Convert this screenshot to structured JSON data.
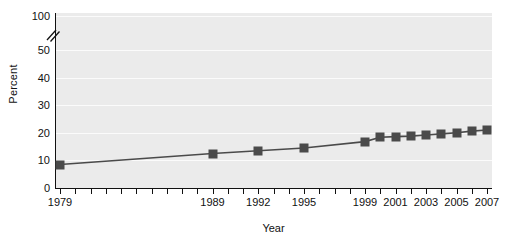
{
  "chart_data": {
    "type": "line",
    "title": "",
    "subtitle": "",
    "xlabel": "Year",
    "ylabel": "Percent",
    "grid": true,
    "legend": false,
    "xlim": [
      1979,
      2007
    ],
    "ylim": [
      0,
      100
    ],
    "y_axis_break": {
      "present": true,
      "between": [
        50,
        100
      ],
      "symbol": "//"
    },
    "y_ticks": [
      0,
      10,
      20,
      30,
      40,
      50,
      100
    ],
    "y_tick_labels": [
      "0",
      "10",
      "20",
      "30",
      "40",
      "50",
      "100"
    ],
    "x_ticks_all_years": [
      1979,
      1980,
      1981,
      1982,
      1983,
      1984,
      1985,
      1986,
      1987,
      1988,
      1989,
      1990,
      1991,
      1992,
      1993,
      1994,
      1995,
      1996,
      1997,
      1998,
      1999,
      2000,
      2001,
      2002,
      2003,
      2004,
      2005,
      2006,
      2007
    ],
    "x_tick_labels": [
      "1979",
      "1989",
      "1992",
      "1995",
      "1999",
      "2001",
      "2003",
      "2005",
      "2007"
    ],
    "x": [
      1979,
      1989,
      1992,
      1995,
      1999,
      2000,
      2001,
      2002,
      2003,
      2004,
      2005,
      2006,
      2007
    ],
    "values": [
      8.5,
      12.5,
      13.5,
      14.5,
      16.8,
      18.4,
      18.6,
      18.8,
      19.2,
      19.6,
      20.0,
      20.6,
      21.0
    ],
    "series": [
      {
        "name": "Percent",
        "color": "#4a4a4a",
        "marker": "square",
        "values": [
          8.5,
          12.5,
          13.5,
          14.5,
          16.8,
          18.4,
          18.6,
          18.8,
          19.2,
          19.6,
          20.0,
          20.6,
          21.0
        ]
      }
    ],
    "colors": {
      "plot_background": "#ebebeb",
      "gridline": "#fbfbfb",
      "axis": "#111111",
      "series": "#4a4a4a",
      "text": "#111111",
      "page_background": "#ffffff"
    }
  }
}
